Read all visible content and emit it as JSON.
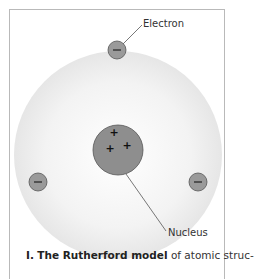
{
  "diagram": {
    "labels": {
      "electron": "Electron",
      "nucleus": "Nucleus"
    },
    "nucleus_charges": [
      "+",
      "+",
      "+"
    ],
    "electron_charges": [
      "−",
      "−",
      "−"
    ],
    "colors": {
      "atom_cloud": "#ececec",
      "nucleus_fill": "#8e8e8e",
      "electron_fill": "#9a9a9a",
      "outline": "#555555"
    }
  },
  "caption": {
    "number": "I.",
    "title": "The Rutherford model",
    "text": " of atomic struc-"
  }
}
